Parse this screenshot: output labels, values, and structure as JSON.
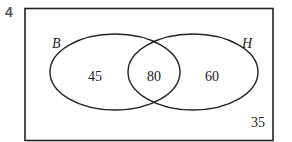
{
  "question_number": "4",
  "venn": {
    "sets": [
      {
        "label": "B",
        "only_value": "45"
      },
      {
        "label": "H",
        "only_value": "60"
      }
    ],
    "intersection_value": "80",
    "outside_value": "35"
  },
  "colors": {
    "stroke": "#222222",
    "question_number": "#555555"
  }
}
